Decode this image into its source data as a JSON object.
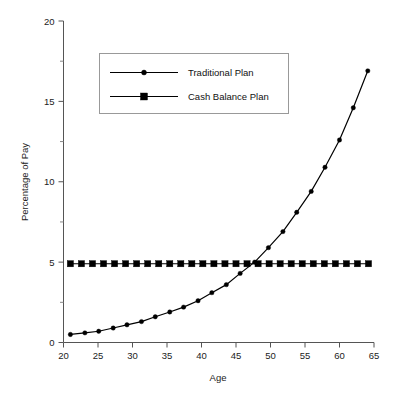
{
  "chart_data": {
    "type": "line",
    "title": "",
    "xlabel": "Age",
    "ylabel": "Percentage of Pay",
    "xlim": [
      20,
      65
    ],
    "ylim": [
      0,
      20
    ],
    "xticks": [
      20,
      25,
      30,
      35,
      40,
      45,
      50,
      55,
      60,
      65
    ],
    "yticks": [
      0,
      5,
      10,
      15,
      20
    ],
    "yticks_minor": [
      2.5,
      7.5,
      12.5,
      17.5
    ],
    "grid": false,
    "legend_position": "upper-left-inside",
    "series": [
      {
        "name": "Traditional Plan",
        "marker": "circle",
        "x": [
          21.0,
          23.1,
          25.1,
          27.2,
          29.2,
          31.3,
          33.3,
          35.4,
          37.4,
          39.5,
          41.5,
          43.6,
          45.6,
          47.7,
          49.7,
          51.8,
          53.8,
          55.9,
          57.9,
          60.0,
          62.0,
          64.1
        ],
        "values": [
          0.5,
          0.6,
          0.7,
          0.9,
          1.1,
          1.3,
          1.6,
          1.9,
          2.2,
          2.6,
          3.1,
          3.6,
          4.3,
          5.0,
          5.9,
          6.9,
          8.1,
          9.4,
          10.9,
          12.6,
          14.6,
          16.9
        ]
      },
      {
        "name": "Cash Balance Plan",
        "marker": "square",
        "x": [
          21.0,
          22.6,
          24.2,
          25.8,
          27.4,
          29.0,
          30.6,
          32.2,
          33.8,
          35.4,
          37.0,
          38.6,
          40.2,
          41.8,
          43.4,
          45.0,
          46.6,
          48.2,
          49.8,
          51.4,
          53.0,
          54.6,
          56.2,
          57.8,
          59.4,
          61.0,
          62.6,
          64.2
        ],
        "values": [
          4.9,
          4.9,
          4.9,
          4.9,
          4.9,
          4.9,
          4.9,
          4.9,
          4.9,
          4.9,
          4.9,
          4.9,
          4.9,
          4.9,
          4.9,
          4.9,
          4.9,
          4.9,
          4.9,
          4.9,
          4.9,
          4.9,
          4.9,
          4.9,
          4.9,
          4.9,
          4.9,
          4.9
        ]
      }
    ],
    "endpoint_peak": 18.0,
    "crossover_age": 48.5,
    "colors": {
      "series_line": "#000000",
      "marker": "#000000",
      "axis": "#555555",
      "legend_border": "#999999",
      "background": "#ffffff"
    }
  },
  "legend": {
    "items": [
      {
        "label": "Traditional Plan",
        "marker": "circle-marker"
      },
      {
        "label": "Cash Balance Plan",
        "marker": "square-marker"
      }
    ]
  }
}
